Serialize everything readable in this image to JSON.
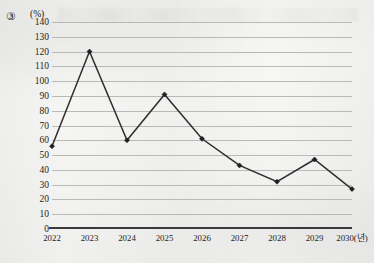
{
  "question_number": "③",
  "unit_label": "(%)",
  "chart_data": {
    "type": "line",
    "title": "",
    "xlabel": "",
    "ylabel": "(%)",
    "x_axis_note": "2030(년)",
    "categories": [
      "2022",
      "2023",
      "2024",
      "2025",
      "2026",
      "2027",
      "2028",
      "2029",
      "2030"
    ],
    "tick_labels": [
      "2022",
      "2023",
      "2024",
      "2025",
      "2026",
      "2027",
      "2028",
      "2029",
      "2030(년)"
    ],
    "values": [
      56,
      120,
      60,
      91,
      61,
      43,
      32,
      47,
      27
    ],
    "ylim": [
      0,
      140
    ],
    "ytick_step": 10,
    "ytick_labels": [
      "140",
      "130",
      "120",
      "110",
      "100",
      "90",
      "80",
      "70",
      "60",
      "50",
      "40",
      "30",
      "20",
      "10",
      "0"
    ],
    "grid": true,
    "legend": "none",
    "marker": "diamond",
    "line_color": "#2e2e2e",
    "grid_color": "#b9b9b9",
    "background_color": "#f6f6f4"
  }
}
